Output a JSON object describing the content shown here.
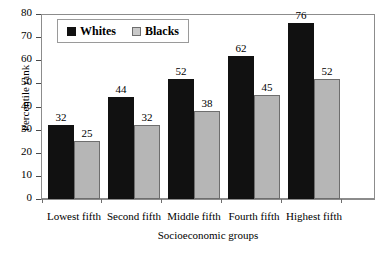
{
  "chart_data": {
    "type": "bar",
    "title": "",
    "xlabel": "Socioeconomic groups",
    "ylabel": "Percentile rank",
    "categories": [
      "Lowest fifth",
      "Second fifth",
      "Middle fifth",
      "Fourth fifth",
      "Highest fifth"
    ],
    "series": [
      {
        "name": "Whites",
        "color": "#111111",
        "values": [
          32,
          44,
          52,
          62,
          76
        ]
      },
      {
        "name": "Blacks",
        "color": "#b6b6b6",
        "values": [
          25,
          32,
          38,
          45,
          52
        ]
      }
    ],
    "ylim": [
      0,
      80
    ],
    "ytick_step": 10,
    "yticks": [
      80,
      70,
      60,
      50,
      40,
      30,
      20,
      10,
      0
    ],
    "grid": false,
    "legend_position": "top-left",
    "data_labels": true
  }
}
